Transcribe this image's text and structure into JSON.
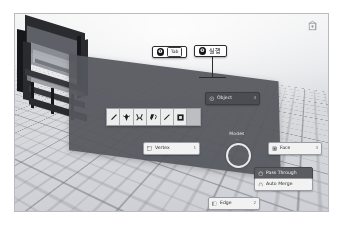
{
  "app": {
    "name": "Blender 3D Viewport",
    "context": "Modes pie menu overlay"
  },
  "viewport": {
    "background_color": "#d9dade",
    "grid_color": "#787c84",
    "model_name": "dark-machinery-frame"
  },
  "callouts": [
    {
      "id": "step-1",
      "number": "❶",
      "key_label": "Tab",
      "kind": "keycap"
    },
    {
      "id": "step-2",
      "number": "❷",
      "text": "실행",
      "kind": "text"
    }
  ],
  "pie_menu": {
    "title": "Modes",
    "subtitle": "—",
    "center_color": "#54565c",
    "items": [
      {
        "id": "object",
        "label": "Object",
        "key": "4",
        "icon": "object-mode-icon",
        "state": "highlight"
      },
      {
        "id": "vertex",
        "label": "Vertex",
        "key": "1",
        "icon": "vertex-select-icon",
        "state": "normal"
      },
      {
        "id": "face",
        "label": "Face",
        "key": "3",
        "icon": "face-select-icon",
        "state": "normal"
      },
      {
        "id": "edge",
        "label": "Edge",
        "key": "2",
        "icon": "edge-select-icon",
        "state": "normal"
      }
    ]
  },
  "option_toggles": [
    {
      "id": "pass-through",
      "label": "Pass Through",
      "icon": "xray-icon",
      "state": "active"
    },
    {
      "id": "auto-merge",
      "label": "Auto Merge",
      "icon": "magnet-icon",
      "state": "inactive"
    }
  ],
  "brush_toolbar": {
    "background_color": "#d4d5d8",
    "tools": [
      {
        "id": "draw",
        "icon": "brush-draw-icon"
      },
      {
        "id": "soften",
        "icon": "brush-soften-icon"
      },
      {
        "id": "smear",
        "icon": "brush-smear-icon"
      },
      {
        "id": "clone",
        "icon": "brush-clone-icon"
      },
      {
        "id": "fill",
        "icon": "brush-fill-icon"
      },
      {
        "id": "mask",
        "icon": "brush-mask-icon"
      },
      {
        "id": "empty-slot",
        "icon": "empty-slot-icon"
      }
    ]
  },
  "nav_gizmo": {
    "icon": "view-gizmo-icon"
  }
}
